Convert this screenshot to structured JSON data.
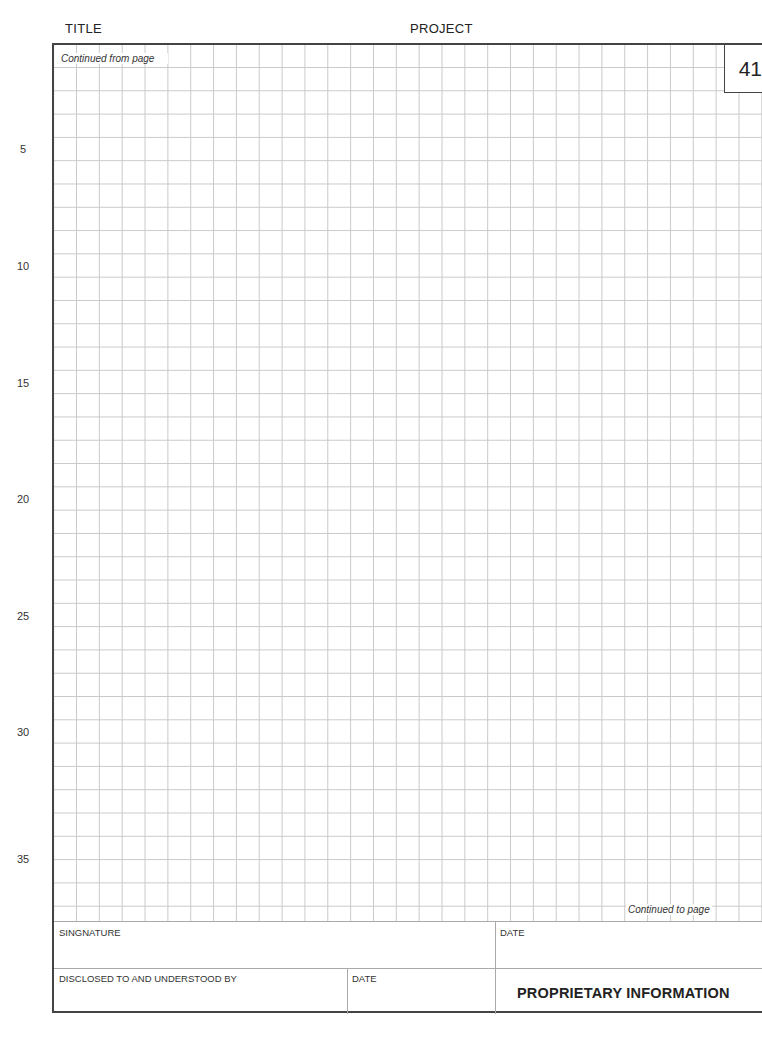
{
  "header": {
    "title_label": "TITLE",
    "project_label": "PROJECT"
  },
  "page": {
    "number": "41",
    "continued_from": "Continued from page",
    "continued_to": "Continued to page"
  },
  "row_numbers": [
    {
      "label": "5",
      "top": 143
    },
    {
      "label": "10",
      "top": 260
    },
    {
      "label": "15",
      "top": 377
    },
    {
      "label": "20",
      "top": 493
    },
    {
      "label": "25",
      "top": 610
    },
    {
      "label": "30",
      "top": 726
    },
    {
      "label": "35",
      "top": 853
    }
  ],
  "footer": {
    "signature_label": "SINGNATURE",
    "date_label_1": "DATE",
    "disclosed_label": "DISCLOSED TO AND UNDERSTOOD BY",
    "date_label_2": "DATE",
    "proprietary": "PROPRIETARY INFORMATION"
  }
}
